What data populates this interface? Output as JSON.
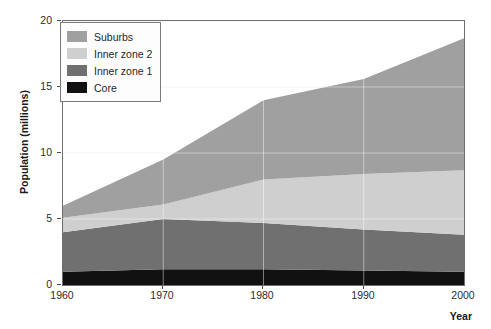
{
  "chart_data": {
    "type": "area",
    "title": "",
    "subtitle": "",
    "xlabel": "Year",
    "ylabel": "Population (millions)",
    "x": [
      1960,
      1970,
      1980,
      1990,
      2000
    ],
    "xtick_labels": [
      "1960",
      "1970",
      "1980",
      "1990",
      "2000"
    ],
    "ytick_labels": [
      "0",
      "5",
      "10",
      "15",
      "20"
    ],
    "ytick_values": [
      0,
      5,
      10,
      15,
      20
    ],
    "xlim": [
      1960,
      2000
    ],
    "ylim": [
      0,
      20
    ],
    "grid": true,
    "stacked": true,
    "legend_position": "upper-left",
    "series": [
      {
        "name": "Core",
        "color": "#111111",
        "values": [
          1.0,
          1.2,
          1.2,
          1.1,
          1.0
        ]
      },
      {
        "name": "Inner zone 1",
        "color": "#707070",
        "values": [
          3.0,
          3.8,
          3.5,
          3.1,
          2.8
        ]
      },
      {
        "name": "Inner zone 2",
        "color": "#cfcfcf",
        "values": [
          1.1,
          1.1,
          3.3,
          4.2,
          4.9
        ]
      },
      {
        "name": "Suburbs",
        "color": "#a0a0a0",
        "values": [
          0.9,
          3.4,
          6.0,
          7.2,
          10.0
        ]
      }
    ],
    "cumulative_tops": {
      "core": [
        1.0,
        1.2,
        1.2,
        1.1,
        1.0
      ],
      "inner_zone_1": [
        4.0,
        5.0,
        4.7,
        4.2,
        3.8
      ],
      "inner_zone_2": [
        5.1,
        6.1,
        8.0,
        8.4,
        8.7
      ],
      "suburbs": [
        6.0,
        9.5,
        14.0,
        15.6,
        18.7
      ]
    },
    "legend": [
      {
        "label": "Suburbs",
        "color": "#a0a0a0"
      },
      {
        "label": "Inner zone 2",
        "color": "#cfcfcf"
      },
      {
        "label": "Inner zone 1",
        "color": "#707070"
      },
      {
        "label": "Core",
        "color": "#111111"
      }
    ],
    "axis_color": "#6e6e6e",
    "grid_color": "#f2f2f2",
    "background": "#ffffff"
  }
}
